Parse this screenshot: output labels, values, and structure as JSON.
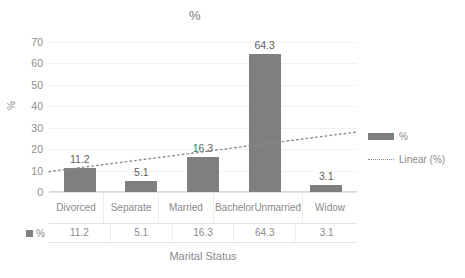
{
  "chart_data": {
    "type": "bar",
    "title": "%",
    "xlabel": "Marital Status",
    "ylabel": "%",
    "categories": [
      "Divorced",
      "Separate",
      "Married",
      "Bachelor Unmarried",
      "Widow"
    ],
    "values": [
      11.2,
      5.1,
      16.3,
      64.3,
      3.1
    ],
    "value_labels": [
      "11.2",
      "5.1",
      "16.3",
      "64.3",
      "3.1"
    ],
    "ylim": [
      0,
      70
    ],
    "yticks": [
      0,
      10,
      20,
      30,
      40,
      50,
      60,
      70
    ],
    "ytick_labels": [
      "0",
      "10",
      "20",
      "30",
      "40",
      "50",
      "60",
      "70"
    ],
    "grid": true,
    "legend_position": "right",
    "series": [
      {
        "name": "%",
        "values": [
          11.2,
          5.1,
          16.3,
          64.3,
          3.1
        ]
      }
    ],
    "trendline": {
      "name": "Linear (%)",
      "style": "dotted",
      "y_start": 9.5,
      "y_end": 28.0
    },
    "data_table": {
      "row_label": "%",
      "headers": [
        "Divorced",
        "Separate",
        "Married",
        "Bachelor Unmarried",
        "Widow"
      ],
      "values": [
        "11.2",
        "5.1",
        "16.3",
        "64.3",
        "3.1"
      ]
    },
    "colors": {
      "bar": "#7f7f7f",
      "trendline": "#8c8c8c",
      "text": "#8a8a8a",
      "gridline": "#f2f2f2",
      "axis": "#d9d9d9",
      "background": "#ffffff"
    }
  },
  "legend": {
    "items": [
      {
        "label": "%",
        "marker": "bar-swatch"
      },
      {
        "label": "Linear (%)",
        "marker": "dotted-line-swatch"
      }
    ]
  },
  "category_lines": {
    "c0": [
      "Divorced"
    ],
    "c1": [
      "Separate"
    ],
    "c2": [
      "Married"
    ],
    "c3": [
      "Bachelor",
      "Unmarried"
    ],
    "c4": [
      "Widow"
    ]
  }
}
